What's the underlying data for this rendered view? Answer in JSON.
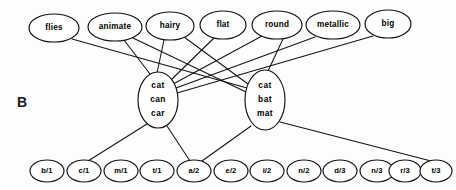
{
  "figure": {
    "panel_letter": "B",
    "width": 456,
    "height": 190,
    "background_color": "#fdfdfd",
    "stroke_color": "#141414"
  },
  "layers": {
    "semantic": {
      "name": "semantic-features",
      "nodes": [
        {
          "id": "flies",
          "label": "flies",
          "cx": 54,
          "cy": 28,
          "rx": 25,
          "ry": 14
        },
        {
          "id": "animate",
          "label": "animate",
          "cx": 115,
          "cy": 27,
          "rx": 27,
          "ry": 14
        },
        {
          "id": "hairy",
          "label": "hairy",
          "cx": 170,
          "cy": 26,
          "rx": 24,
          "ry": 14
        },
        {
          "id": "flat",
          "label": "flat",
          "cx": 223,
          "cy": 25,
          "rx": 23,
          "ry": 14
        },
        {
          "id": "round",
          "label": "round",
          "cx": 277,
          "cy": 25,
          "rx": 25,
          "ry": 14
        },
        {
          "id": "metallic",
          "label": "metallic",
          "cx": 333,
          "cy": 25,
          "rx": 27,
          "ry": 14
        },
        {
          "id": "big",
          "label": "big",
          "cx": 388,
          "cy": 24,
          "rx": 23,
          "ry": 14
        }
      ]
    },
    "word": {
      "name": "word-forms",
      "nodes": [
        {
          "id": "cat-can-car",
          "lines": [
            "cat",
            "can",
            "car"
          ],
          "cx": 158,
          "cy": 100,
          "rx": 20,
          "ry": 28
        },
        {
          "id": "cat-bat-mat",
          "lines": [
            "cat",
            "bat",
            "mat"
          ],
          "cx": 265,
          "cy": 100,
          "rx": 20,
          "ry": 30
        }
      ]
    },
    "phoneme": {
      "name": "phoneme-slots",
      "nodes": [
        {
          "id": "b1",
          "label": "b/1",
          "cx": 47,
          "cy": 171,
          "rx": 17,
          "ry": 11
        },
        {
          "id": "c1",
          "label": "c/1",
          "cx": 84,
          "cy": 171,
          "rx": 17,
          "ry": 11
        },
        {
          "id": "m1",
          "label": "m/1",
          "cx": 121,
          "cy": 171,
          "rx": 17,
          "ry": 11
        },
        {
          "id": "t1",
          "label": "t/1",
          "cx": 157,
          "cy": 171,
          "rx": 17,
          "ry": 11
        },
        {
          "id": "a2",
          "label": "a/2",
          "cx": 194,
          "cy": 171,
          "rx": 17,
          "ry": 11
        },
        {
          "id": "e2",
          "label": "e/2",
          "cx": 231,
          "cy": 171,
          "rx": 17,
          "ry": 11
        },
        {
          "id": "i2",
          "label": "i/2",
          "cx": 267,
          "cy": 171,
          "rx": 17,
          "ry": 11
        },
        {
          "id": "n2",
          "label": "n/2",
          "cx": 304,
          "cy": 171,
          "rx": 17,
          "ry": 11
        },
        {
          "id": "d3",
          "label": "d/3",
          "cx": 340,
          "cy": 171,
          "rx": 17,
          "ry": 11
        },
        {
          "id": "n3",
          "label": "n/3",
          "cx": 377,
          "cy": 171,
          "rx": 17,
          "ry": 11
        },
        {
          "id": "r3",
          "label": "r/3",
          "cx": 405,
          "cy": 171,
          "rx": 16,
          "ry": 11
        },
        {
          "id": "t3",
          "label": "t/3",
          "cx": 436,
          "cy": 171,
          "rx": 16,
          "ry": 11
        }
      ]
    }
  },
  "edges": {
    "semantic_to_word": [
      {
        "from": "flies",
        "to": "cat-bat-mat",
        "x1": 72,
        "y1": 39,
        "x2": 247,
        "y2": 88
      },
      {
        "from": "animate",
        "to": "cat-can-car",
        "x1": 124,
        "y1": 40,
        "x2": 150,
        "y2": 74
      },
      {
        "from": "animate",
        "to": "cat-bat-mat",
        "x1": 133,
        "y1": 38,
        "x2": 246,
        "y2": 92
      },
      {
        "from": "hairy",
        "to": "cat-can-car",
        "x1": 164,
        "y1": 40,
        "x2": 157,
        "y2": 73
      },
      {
        "from": "hairy",
        "to": "cat-bat-mat",
        "x1": 184,
        "y1": 37,
        "x2": 248,
        "y2": 84
      },
      {
        "from": "flat",
        "to": "cat-can-car",
        "x1": 214,
        "y1": 38,
        "x2": 172,
        "y2": 79
      },
      {
        "from": "round",
        "to": "cat-can-car",
        "x1": 262,
        "y1": 36,
        "x2": 175,
        "y2": 83
      },
      {
        "from": "round",
        "to": "cat-bat-mat",
        "x1": 283,
        "y1": 39,
        "x2": 268,
        "y2": 71
      },
      {
        "from": "metallic",
        "to": "cat-can-car",
        "x1": 315,
        "y1": 37,
        "x2": 176,
        "y2": 88
      },
      {
        "from": "big",
        "to": "cat-can-car",
        "x1": 373,
        "y1": 36,
        "x2": 177,
        "y2": 93
      }
    ],
    "word_to_phoneme": [
      {
        "from": "cat-can-car",
        "to": "c1",
        "x1": 147,
        "y1": 124,
        "x2": 88,
        "y2": 161
      },
      {
        "from": "cat-can-car",
        "to": "a2",
        "x1": 167,
        "y1": 126,
        "x2": 190,
        "y2": 161
      },
      {
        "from": "cat-bat-mat",
        "to": "a2",
        "x1": 251,
        "y1": 126,
        "x2": 202,
        "y2": 161
      },
      {
        "from": "cat-bat-mat",
        "to": "t3",
        "x1": 280,
        "y1": 122,
        "x2": 431,
        "y2": 161
      }
    ]
  },
  "panel_label": {
    "text": "B",
    "x": 22,
    "y": 103
  }
}
